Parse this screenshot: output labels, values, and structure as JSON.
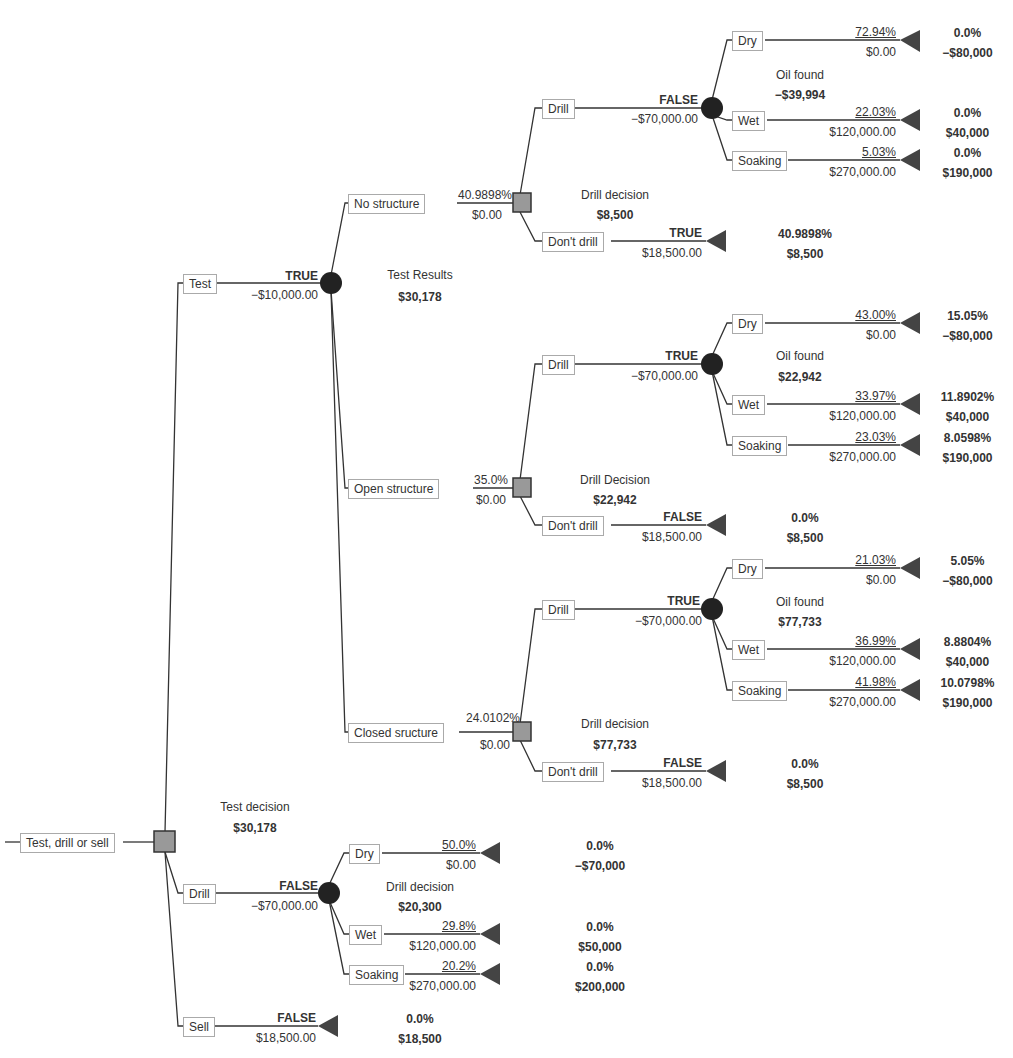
{
  "root": {
    "label": "Test, drill or sell",
    "node_name": "Test decision",
    "value": "$30,178"
  },
  "test": {
    "label": "Test",
    "flag": "TRUE",
    "cost": "−$10,000.00",
    "node_name": "Test Results",
    "value": "$30,178",
    "outcomes": [
      {
        "label": "No structure",
        "prob": "40.9898%",
        "cost": "$0.00",
        "node_name": "Drill decision",
        "value": "$8,500",
        "drill": {
          "label": "Drill",
          "flag": "FALSE",
          "cost": "−$70,000.00",
          "node_name": "Oil found",
          "value": "−$39,994",
          "leaves": [
            {
              "label": "Dry",
              "prob": "72.94%",
              "payoff": "$0.00",
              "end_prob": "0.0%",
              "end_value": "−$80,000"
            },
            {
              "label": "Wet",
              "prob": "22.03%",
              "payoff": "$120,000.00",
              "end_prob": "0.0%",
              "end_value": "$40,000"
            },
            {
              "label": "Soaking",
              "prob": "5.03%",
              "payoff": "$270,000.00",
              "end_prob": "0.0%",
              "end_value": "$190,000"
            }
          ]
        },
        "dont_drill": {
          "label": "Don't drill",
          "flag": "TRUE",
          "payoff": "$18,500.00",
          "end_prob": "40.9898%",
          "end_value": "$8,500"
        }
      },
      {
        "label": "Open structure",
        "prob": "35.0%",
        "cost": "$0.00",
        "node_name": "Drill Decision",
        "value": "$22,942",
        "drill": {
          "label": "Drill",
          "flag": "TRUE",
          "cost": "−$70,000.00",
          "node_name": "Oil found",
          "value": "$22,942",
          "leaves": [
            {
              "label": "Dry",
              "prob": "43.00%",
              "payoff": "$0.00",
              "end_prob": "15.05%",
              "end_value": "−$80,000"
            },
            {
              "label": "Wet",
              "prob": "33.97%",
              "payoff": "$120,000.00",
              "end_prob": "11.8902%",
              "end_value": "$40,000"
            },
            {
              "label": "Soaking",
              "prob": "23.03%",
              "payoff": "$270,000.00",
              "end_prob": "8.0598%",
              "end_value": "$190,000"
            }
          ]
        },
        "dont_drill": {
          "label": "Don't drill",
          "flag": "FALSE",
          "payoff": "$18,500.00",
          "end_prob": "0.0%",
          "end_value": "$8,500"
        }
      },
      {
        "label": "Closed sructure",
        "prob": "24.0102%",
        "cost": "$0.00",
        "node_name": "Drill decision",
        "value": "$77,733",
        "drill": {
          "label": "Drill",
          "flag": "TRUE",
          "cost": "−$70,000.00",
          "node_name": "Oil found",
          "value": "$77,733",
          "leaves": [
            {
              "label": "Dry",
              "prob": "21.03%",
              "payoff": "$0.00",
              "end_prob": "5.05%",
              "end_value": "−$80,000"
            },
            {
              "label": "Wet",
              "prob": "36.99%",
              "payoff": "$120,000.00",
              "end_prob": "8.8804%",
              "end_value": "$40,000"
            },
            {
              "label": "Soaking",
              "prob": "41.98%",
              "payoff": "$270,000.00",
              "end_prob": "10.0798%",
              "end_value": "$190,000"
            }
          ]
        },
        "dont_drill": {
          "label": "Don't drill",
          "flag": "FALSE",
          "payoff": "$18,500.00",
          "end_prob": "0.0%",
          "end_value": "$8,500"
        }
      }
    ]
  },
  "drill": {
    "label": "Drill",
    "flag": "FALSE",
    "cost": "−$70,000.00",
    "node_name": "Drill decision",
    "value": "$20,300",
    "leaves": [
      {
        "label": "Dry",
        "prob": "50.0%",
        "payoff": "$0.00",
        "end_prob": "0.0%",
        "end_value": "−$70,000"
      },
      {
        "label": "Wet",
        "prob": "29.8%",
        "payoff": "$120,000.00",
        "end_prob": "0.0%",
        "end_value": "$50,000"
      },
      {
        "label": "Soaking",
        "prob": "20.2%",
        "payoff": "$270,000.00",
        "end_prob": "0.0%",
        "end_value": "$200,000"
      }
    ]
  },
  "sell": {
    "label": "Sell",
    "flag": "FALSE",
    "payoff": "$18,500.00",
    "end_prob": "0.0%",
    "end_value": "$18,500"
  },
  "colors": {
    "line": "#333333",
    "decision_fill": "#999999",
    "chance_fill": "#222222",
    "terminal_fill": "#444444"
  }
}
